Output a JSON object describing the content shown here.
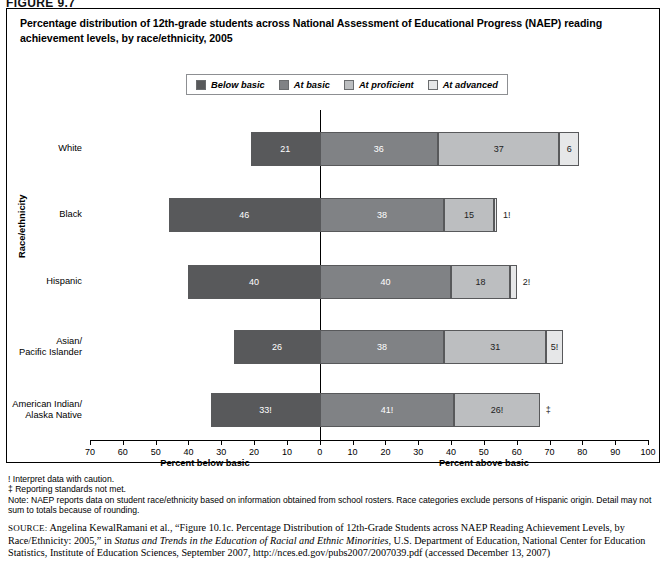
{
  "figure": {
    "label": "FIGURE 9.7"
  },
  "title": "Percentage distribution of 12th-grade students across National Assessment of Educational Progress (NAEP) reading achievement levels, by race/ethnicity, 2005",
  "legend": {
    "items": [
      {
        "label": "Below basic",
        "color": "#58595b"
      },
      {
        "label": "At basic",
        "color": "#808285"
      },
      {
        "label": "At proficient",
        "color": "#bcbec0"
      },
      {
        "label": "At advanced",
        "color": "#e6e7e8"
      }
    ]
  },
  "axes": {
    "ylabel": "Race/ethnicity",
    "left_title": "Percent below basic",
    "right_title": "Percent above basic",
    "ticks": [
      -70,
      -60,
      -50,
      -40,
      -30,
      -20,
      -10,
      0,
      10,
      20,
      30,
      40,
      50,
      60,
      70,
      80,
      90,
      100
    ],
    "tick_labels": [
      "70",
      "60",
      "50",
      "40",
      "30",
      "20",
      "10",
      "0",
      "10",
      "20",
      "30",
      "40",
      "50",
      "60",
      "70",
      "80",
      "90",
      "100"
    ],
    "min": -70,
    "max": 100
  },
  "chart_data": {
    "type": "bar",
    "title": "Percentage distribution of 12th-grade students across National Assessment of Educational Progress (NAEP) reading achievement levels, by race/ethnicity, 2005",
    "xlabel": "Percent below basic / Percent above basic",
    "ylabel": "Race/ethnicity",
    "xlim": [
      -70,
      100
    ],
    "grid": false,
    "legend_position": "top",
    "orientation": "horizontal-diverging",
    "categories": [
      "White",
      "Black",
      "Hispanic",
      "Asian/\nPacific Islander",
      "American Indian/\nAlaska Native"
    ],
    "series": [
      {
        "name": "Below basic",
        "values": [
          21,
          46,
          40,
          26,
          33
        ],
        "labels": [
          "21",
          "46",
          "40",
          "26",
          "33!"
        ]
      },
      {
        "name": "At basic",
        "values": [
          36,
          38,
          40,
          38,
          41
        ],
        "labels": [
          "36",
          "38",
          "40",
          "38",
          "41!"
        ]
      },
      {
        "name": "At proficient",
        "values": [
          37,
          15,
          18,
          31,
          26
        ],
        "labels": [
          "37",
          "15",
          "18",
          "31",
          "26!"
        ]
      },
      {
        "name": "At advanced",
        "values": [
          6,
          1,
          2,
          5,
          0
        ],
        "labels": [
          "6",
          "1!",
          "2!",
          "5!",
          "‡"
        ]
      }
    ]
  },
  "rows": [
    {
      "category": "White",
      "segments": [
        {
          "level": "Below basic",
          "value": 21,
          "label": "21",
          "inside": true
        },
        {
          "level": "At basic",
          "value": 36,
          "label": "36",
          "inside": true
        },
        {
          "level": "At proficient",
          "value": 37,
          "label": "37",
          "inside": true
        },
        {
          "level": "At advanced",
          "value": 6,
          "label": "6",
          "inside": true
        }
      ]
    },
    {
      "category": "Black",
      "segments": [
        {
          "level": "Below basic",
          "value": 46,
          "label": "46",
          "inside": true
        },
        {
          "level": "At basic",
          "value": 38,
          "label": "38",
          "inside": true
        },
        {
          "level": "At proficient",
          "value": 15,
          "label": "15",
          "inside": true
        },
        {
          "level": "At advanced",
          "value": 1,
          "label": "1!",
          "inside": false
        }
      ]
    },
    {
      "category": "Hispanic",
      "segments": [
        {
          "level": "Below basic",
          "value": 40,
          "label": "40",
          "inside": true
        },
        {
          "level": "At basic",
          "value": 40,
          "label": "40",
          "inside": true
        },
        {
          "level": "At proficient",
          "value": 18,
          "label": "18",
          "inside": true
        },
        {
          "level": "At advanced",
          "value": 2,
          "label": "2!",
          "inside": false
        }
      ]
    },
    {
      "category": "Asian/\nPacific Islander",
      "segments": [
        {
          "level": "Below basic",
          "value": 26,
          "label": "26",
          "inside": true
        },
        {
          "level": "At basic",
          "value": 38,
          "label": "38",
          "inside": true
        },
        {
          "level": "At proficient",
          "value": 31,
          "label": "31",
          "inside": true
        },
        {
          "level": "At advanced",
          "value": 5,
          "label": "5!",
          "inside": true
        }
      ]
    },
    {
      "category": "American Indian/\nAlaska Native",
      "segments": [
        {
          "level": "Below basic",
          "value": 33,
          "label": "33!",
          "inside": true
        },
        {
          "level": "At basic",
          "value": 41,
          "label": "41!",
          "inside": true
        },
        {
          "level": "At proficient",
          "value": 26,
          "label": "26!",
          "inside": true
        },
        {
          "level": "At advanced",
          "value": 0,
          "label": "‡",
          "inside": false
        }
      ]
    }
  ],
  "notes": {
    "caution": "! Interpret data with caution.",
    "standards": "‡ Reporting standards not met.",
    "note": "Note: NAEP reports data on student race/ethnicity based on information obtained from school rosters. Race categories exclude persons of Hispanic origin. Detail may not sum to totals because of rounding."
  },
  "source": {
    "label": "SOURCE:",
    "text_1": " Angelina KewalRamani et al., “Figure 10.1c. Percentage Distribution of 12th-Grade Students across NAEP Reading Achievement Levels, by Race/Ethnicity: 2005,” in ",
    "italic_1": "Status and Trends in the Education of Racial and Ethnic Minorities",
    "text_2": ", U.S. Department of Education, National Center for Education Statistics, Institute of Education Sciences, September 2007, http://nces.ed.gov/pubs2007/2007039.pdf (accessed December 13, 2007)"
  }
}
